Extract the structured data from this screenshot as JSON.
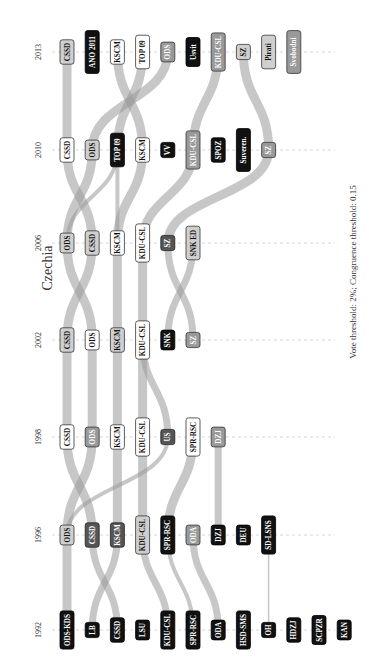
{
  "chart_data": {
    "type": "alluvial",
    "title": "Czechia",
    "note": "Vote threshold: 2%; Congruence threshold: 0.15",
    "orientation": "rotated-90-ccw",
    "years": [
      "1992",
      "1996",
      "1998",
      "2002",
      "2006",
      "2010",
      "2013"
    ],
    "parties": {
      "1992": [
        {
          "label": "ODS-KDS",
          "style": "black"
        },
        {
          "label": "LB",
          "style": "black"
        },
        {
          "label": "CSSD",
          "style": "black"
        },
        {
          "label": "LSU",
          "style": "black"
        },
        {
          "label": "KDU-CSL",
          "style": "black"
        },
        {
          "label": "SPR-RSC",
          "style": "black"
        },
        {
          "label": "ODA",
          "style": "black"
        },
        {
          "label": "HSD-SMS",
          "style": "black"
        },
        {
          "label": "OH",
          "style": "black"
        },
        {
          "label": "HDZJ",
          "style": "black"
        },
        {
          "label": "SCPZR",
          "style": "black"
        },
        {
          "label": "KAN",
          "style": "black"
        }
      ],
      "1996": [
        {
          "label": "ODS",
          "style": "light"
        },
        {
          "label": "CSSD",
          "style": "dark"
        },
        {
          "label": "KSCM",
          "style": "dark"
        },
        {
          "label": "KDU-CSL",
          "style": "light"
        },
        {
          "label": "SPR-RSC",
          "style": "black"
        },
        {
          "label": "ODA",
          "style": "mid"
        },
        {
          "label": "DZJ",
          "style": "black"
        },
        {
          "label": "DEU",
          "style": "black"
        },
        {
          "label": "SD-LSNS",
          "style": "black"
        }
      ],
      "1998": [
        {
          "label": "CSSD",
          "style": "white"
        },
        {
          "label": "ODS",
          "style": "mid"
        },
        {
          "label": "KSCM",
          "style": "white"
        },
        {
          "label": "KDU-CSL",
          "style": "white"
        },
        {
          "label": "US",
          "style": "dark"
        },
        {
          "label": "SPR-RSC",
          "style": "white"
        },
        {
          "label": "DZJ",
          "style": "mid"
        }
      ],
      "2002": [
        {
          "label": "CSSD",
          "style": "light"
        },
        {
          "label": "ODS",
          "style": "white"
        },
        {
          "label": "KSCM",
          "style": "light"
        },
        {
          "label": "KDU-CSL",
          "style": "white"
        },
        {
          "label": "SNK",
          "style": "black"
        },
        {
          "label": "SZ",
          "style": "mid"
        }
      ],
      "2006": [
        {
          "label": "ODS",
          "style": "light"
        },
        {
          "label": "CSSD",
          "style": "light"
        },
        {
          "label": "KSCM",
          "style": "white"
        },
        {
          "label": "KDU-CSL",
          "style": "white"
        },
        {
          "label": "SZ",
          "style": "dark"
        },
        {
          "label": "SNK ED",
          "style": "light"
        }
      ],
      "2010": [
        {
          "label": "CSSD",
          "style": "white"
        },
        {
          "label": "ODS",
          "style": "light"
        },
        {
          "label": "TOP 09",
          "style": "black"
        },
        {
          "label": "KSCM",
          "style": "white"
        },
        {
          "label": "VV",
          "style": "black"
        },
        {
          "label": "KDU-CSL",
          "style": "mid"
        },
        {
          "label": "SPOZ",
          "style": "black"
        },
        {
          "label": "Suveren.",
          "style": "black"
        },
        {
          "label": "SZ",
          "style": "mid"
        }
      ],
      "2013": [
        {
          "label": "CSSD",
          "style": "light"
        },
        {
          "label": "ANO 2011",
          "style": "black"
        },
        {
          "label": "KSCM",
          "style": "white"
        },
        {
          "label": "TOP 09",
          "style": "white"
        },
        {
          "label": "ODS",
          "style": "mid"
        },
        {
          "label": "Usvit",
          "style": "black"
        },
        {
          "label": "KDU-CSL",
          "style": "mid"
        },
        {
          "label": "SZ",
          "style": "light"
        },
        {
          "label": "Pirati",
          "style": "light"
        },
        {
          "label": "Svobodni",
          "style": "mid"
        }
      ]
    },
    "flows": [
      {
        "from": [
          "1992",
          "ODS-KDS"
        ],
        "to": [
          "1996",
          "ODS"
        ],
        "weight": "thick"
      },
      {
        "from": [
          "1992",
          "LB"
        ],
        "to": [
          "1996",
          "KSCM"
        ],
        "weight": "medium"
      },
      {
        "from": [
          "1992",
          "CSSD"
        ],
        "to": [
          "1996",
          "CSSD"
        ],
        "weight": "medium"
      },
      {
        "from": [
          "1992",
          "KDU-CSL"
        ],
        "to": [
          "1996",
          "KDU-CSL"
        ],
        "weight": "medium"
      },
      {
        "from": [
          "1992",
          "SPR-RSC"
        ],
        "to": [
          "1996",
          "SPR-RSC"
        ],
        "weight": "thin"
      },
      {
        "from": [
          "1992",
          "ODA"
        ],
        "to": [
          "1996",
          "ODA"
        ],
        "weight": "medium"
      },
      {
        "from": [
          "1992",
          "OH"
        ],
        "to": [
          "1996",
          "SD-LSNS"
        ],
        "weight": "hair"
      },
      {
        "from": [
          "1996",
          "ODS"
        ],
        "to": [
          "1998",
          "ODS"
        ],
        "weight": "thick"
      },
      {
        "from": [
          "1996",
          "ODS"
        ],
        "to": [
          "1998",
          "US"
        ],
        "weight": "thin"
      },
      {
        "from": [
          "1996",
          "CSSD"
        ],
        "to": [
          "1998",
          "CSSD"
        ],
        "weight": "thick"
      },
      {
        "from": [
          "1996",
          "KSCM"
        ],
        "to": [
          "1998",
          "KSCM"
        ],
        "weight": "thick"
      },
      {
        "from": [
          "1996",
          "KDU-CSL"
        ],
        "to": [
          "1998",
          "KDU-CSL"
        ],
        "weight": "thick"
      },
      {
        "from": [
          "1996",
          "SPR-RSC"
        ],
        "to": [
          "1998",
          "SPR-RSC"
        ],
        "weight": "thick"
      },
      {
        "from": [
          "1996",
          "DZJ"
        ],
        "to": [
          "1998",
          "DZJ"
        ],
        "weight": "medium"
      },
      {
        "from": [
          "1998",
          "CSSD"
        ],
        "to": [
          "2002",
          "CSSD"
        ],
        "weight": "thick"
      },
      {
        "from": [
          "1998",
          "ODS"
        ],
        "to": [
          "2002",
          "ODS"
        ],
        "weight": "thick"
      },
      {
        "from": [
          "1998",
          "KSCM"
        ],
        "to": [
          "2002",
          "KSCM"
        ],
        "weight": "thick"
      },
      {
        "from": [
          "1998",
          "KDU-CSL"
        ],
        "to": [
          "2002",
          "KDU-CSL"
        ],
        "weight": "thick"
      },
      {
        "from": [
          "1998",
          "US"
        ],
        "to": [
          "2002",
          "KDU-CSL"
        ],
        "weight": "medium"
      },
      {
        "from": [
          "2002",
          "CSSD"
        ],
        "to": [
          "2006",
          "CSSD"
        ],
        "weight": "thick"
      },
      {
        "from": [
          "2002",
          "ODS"
        ],
        "to": [
          "2006",
          "ODS"
        ],
        "weight": "thick"
      },
      {
        "from": [
          "2002",
          "KSCM"
        ],
        "to": [
          "2006",
          "KSCM"
        ],
        "weight": "thick"
      },
      {
        "from": [
          "2002",
          "KDU-CSL"
        ],
        "to": [
          "2006",
          "KDU-CSL"
        ],
        "weight": "thick"
      },
      {
        "from": [
          "2002",
          "SNK"
        ],
        "to": [
          "2006",
          "SNK ED"
        ],
        "weight": "medium"
      },
      {
        "from": [
          "2002",
          "SZ"
        ],
        "to": [
          "2006",
          "SZ"
        ],
        "weight": "medium"
      },
      {
        "from": [
          "2006",
          "CSSD"
        ],
        "to": [
          "2010",
          "CSSD"
        ],
        "weight": "thick"
      },
      {
        "from": [
          "2006",
          "ODS"
        ],
        "to": [
          "2010",
          "ODS"
        ],
        "weight": "thick"
      },
      {
        "from": [
          "2006",
          "KSCM"
        ],
        "to": [
          "2010",
          "KSCM"
        ],
        "weight": "thick"
      },
      {
        "from": [
          "2006",
          "KSCM"
        ],
        "to": [
          "2010",
          "TOP 09"
        ],
        "weight": "thin"
      },
      {
        "from": [
          "2006",
          "KDU-CSL"
        ],
        "to": [
          "2010",
          "KDU-CSL"
        ],
        "weight": "thick"
      },
      {
        "from": [
          "2006",
          "SZ"
        ],
        "to": [
          "2010",
          "SZ"
        ],
        "weight": "thick"
      },
      {
        "from": [
          "2006",
          "ODS"
        ],
        "to": [
          "2010",
          "TOP 09"
        ],
        "weight": "thin"
      },
      {
        "from": [
          "2010",
          "CSSD"
        ],
        "to": [
          "2013",
          "CSSD"
        ],
        "weight": "thick"
      },
      {
        "from": [
          "2010",
          "ODS"
        ],
        "to": [
          "2013",
          "ODS"
        ],
        "weight": "thick"
      },
      {
        "from": [
          "2010",
          "TOP 09"
        ],
        "to": [
          "2013",
          "TOP 09"
        ],
        "weight": "thick"
      },
      {
        "from": [
          "2010",
          "KSCM"
        ],
        "to": [
          "2013",
          "KSCM"
        ],
        "weight": "thick"
      },
      {
        "from": [
          "2010",
          "KDU-CSL"
        ],
        "to": [
          "2013",
          "KDU-CSL"
        ],
        "weight": "thick"
      },
      {
        "from": [
          "2010",
          "SZ"
        ],
        "to": [
          "2013",
          "SZ"
        ],
        "weight": "thick"
      }
    ],
    "xlabel": "",
    "ylabel": "",
    "grid": "dashed guide line per election year",
    "legend": "none"
  }
}
